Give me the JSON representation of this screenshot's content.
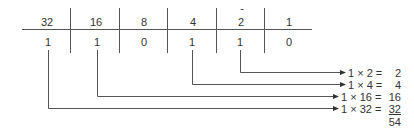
{
  "place_values": [
    "32",
    "16",
    "8",
    "4",
    "2",
    "1"
  ],
  "bits": [
    "1",
    "1",
    "0",
    "1",
    "1",
    "0"
  ],
  "products": [
    {
      "expr": "1 × 2 =",
      "result": "2"
    },
    {
      "expr": "1 × 4 =",
      "result": "4"
    },
    {
      "expr": "1 × 16 =",
      "result": "16"
    },
    {
      "expr": "1 × 32 =",
      "result": "32"
    }
  ],
  "total": "54",
  "marker": "-"
}
